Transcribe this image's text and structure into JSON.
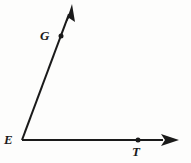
{
  "figure": {
    "kind": "geometry-angle-diagram",
    "stroke_color": "#1a1a1a",
    "background_color": "#fdfdfc",
    "stroke_width": 2,
    "labels": {
      "vertex": "E",
      "ray_up_point": "G",
      "ray_right_point": "T"
    },
    "points": {
      "E": {
        "x": 22,
        "y": 140
      },
      "G": {
        "x": 61,
        "y": 36
      },
      "T": {
        "x": 138,
        "y": 140
      }
    },
    "rays": [
      {
        "name": "ray-EG",
        "from": "E",
        "through": "G",
        "tip": {
          "x": 72,
          "y": 5
        },
        "arrow": true
      },
      {
        "name": "ray-ET",
        "from": "E",
        "through": "T",
        "tip": {
          "x": 178,
          "y": 140
        },
        "arrow": true
      }
    ]
  }
}
